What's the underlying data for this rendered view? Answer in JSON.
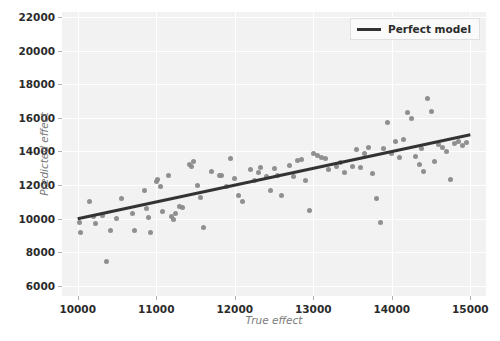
{
  "chart_data": {
    "type": "scatter",
    "title": "",
    "xlabel": "True effect",
    "ylabel": "Predicted effect",
    "xlim": [
      9800,
      15200
    ],
    "ylim": [
      5400,
      22300
    ],
    "xticks": [
      10000,
      11000,
      12000,
      13000,
      14000,
      15000
    ],
    "yticks": [
      6000,
      8000,
      10000,
      12000,
      14000,
      16000,
      18000,
      20000,
      22000
    ],
    "xticklabels": [
      "10000",
      "11000",
      "12000",
      "13000",
      "14000",
      "15000"
    ],
    "yticklabels": [
      "6000",
      "8000",
      "10000",
      "12000",
      "14000",
      "16000",
      "18000",
      "20000",
      "22000"
    ],
    "grid": true,
    "legend": {
      "position": "upper right",
      "entries": [
        {
          "label": "Perfect model",
          "type": "line",
          "color": "#333333"
        }
      ]
    },
    "series": [
      {
        "name": "scatter-points",
        "type": "scatter",
        "color": "#8a8a8a",
        "marker": "circle",
        "points": [
          [
            10020,
            9800
          ],
          [
            10040,
            9150
          ],
          [
            10150,
            11050
          ],
          [
            10200,
            10150
          ],
          [
            10230,
            9700
          ],
          [
            10310,
            10200
          ],
          [
            10370,
            7470
          ],
          [
            10420,
            9280
          ],
          [
            10500,
            10000
          ],
          [
            10560,
            11200
          ],
          [
            10700,
            10300
          ],
          [
            10720,
            9300
          ],
          [
            10850,
            11700
          ],
          [
            10880,
            10600
          ],
          [
            10900,
            10050
          ],
          [
            10930,
            9200
          ],
          [
            11000,
            12200
          ],
          [
            11010,
            12350
          ],
          [
            11050,
            11900
          ],
          [
            11080,
            10450
          ],
          [
            11150,
            12600
          ],
          [
            11200,
            10150
          ],
          [
            11220,
            9950
          ],
          [
            11250,
            10300
          ],
          [
            11300,
            10750
          ],
          [
            11340,
            10650
          ],
          [
            11420,
            13250
          ],
          [
            11450,
            13100
          ],
          [
            11480,
            13400
          ],
          [
            11520,
            11950
          ],
          [
            11560,
            11250
          ],
          [
            11600,
            9450
          ],
          [
            11700,
            12800
          ],
          [
            11800,
            12550
          ],
          [
            11830,
            12600
          ],
          [
            11900,
            11900
          ],
          [
            11950,
            13600
          ],
          [
            12000,
            12400
          ],
          [
            12050,
            11400
          ],
          [
            12100,
            11000
          ],
          [
            12200,
            12900
          ],
          [
            12250,
            12250
          ],
          [
            12300,
            12750
          ],
          [
            12330,
            13050
          ],
          [
            12400,
            12500
          ],
          [
            12450,
            11650
          ],
          [
            12500,
            13000
          ],
          [
            12550,
            12600
          ],
          [
            12600,
            11400
          ],
          [
            12700,
            13150
          ],
          [
            12750,
            12500
          ],
          [
            12800,
            13450
          ],
          [
            12850,
            13500
          ],
          [
            12900,
            12300
          ],
          [
            12950,
            10500
          ],
          [
            13000,
            13900
          ],
          [
            13050,
            13750
          ],
          [
            13100,
            13650
          ],
          [
            13150,
            13600
          ],
          [
            13200,
            12950
          ],
          [
            13300,
            13100
          ],
          [
            13350,
            13350
          ],
          [
            13400,
            12750
          ],
          [
            13500,
            13100
          ],
          [
            13550,
            14100
          ],
          [
            13600,
            13050
          ],
          [
            13650,
            13900
          ],
          [
            13700,
            14250
          ],
          [
            13750,
            12700
          ],
          [
            13800,
            11200
          ],
          [
            13850,
            9800
          ],
          [
            13900,
            14150
          ],
          [
            13950,
            15750
          ],
          [
            14000,
            13900
          ],
          [
            14050,
            14600
          ],
          [
            14100,
            13650
          ],
          [
            14150,
            14700
          ],
          [
            14200,
            16300
          ],
          [
            14250,
            15950
          ],
          [
            14300,
            13700
          ],
          [
            14350,
            13200
          ],
          [
            14380,
            14150
          ],
          [
            14400,
            12800
          ],
          [
            14450,
            17150
          ],
          [
            14500,
            16400
          ],
          [
            14550,
            13400
          ],
          [
            14600,
            14400
          ],
          [
            14650,
            14250
          ],
          [
            14700,
            14000
          ],
          [
            14750,
            12350
          ],
          [
            14800,
            14500
          ],
          [
            14850,
            14600
          ],
          [
            14900,
            14350
          ],
          [
            14950,
            14550
          ]
        ]
      },
      {
        "name": "Perfect model",
        "type": "line",
        "color": "#333333",
        "linewidth": 3,
        "x": [
          10000,
          15000
        ],
        "y": [
          10000,
          15000
        ]
      }
    ]
  },
  "legend": {
    "perfect_model_label": "Perfect model"
  },
  "axes": {
    "xlabel": "True effect",
    "ylabel": "Predicted effect"
  }
}
